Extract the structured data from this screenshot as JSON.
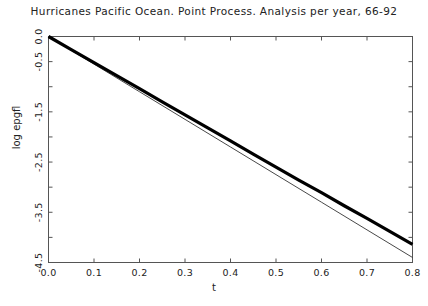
{
  "chart_data": {
    "type": "line",
    "title": "Hurricanes Pacific Ocean. Point Process. Analysis per year, 66-92",
    "xlabel": "t",
    "ylabel": "log epgfl",
    "xlim": [
      0.0,
      0.8
    ],
    "ylim": [
      -4.5,
      0.0
    ],
    "grid": false,
    "legend": null,
    "xticks": [
      0.0,
      0.1,
      0.2,
      0.3,
      0.4,
      0.5,
      0.6,
      0.7,
      0.8
    ],
    "xticklabels": [
      "0.0",
      "0.1",
      "0.2",
      "0.3",
      "0.4",
      "0.5",
      "0.6",
      "0.7",
      "0.8"
    ],
    "yticks": [
      0.0,
      -0.5,
      -1.0,
      -1.5,
      -2.0,
      -2.5,
      -3.0,
      -3.5,
      -4.0,
      -4.5
    ],
    "yticklabels": [
      "0.0",
      "-0.5",
      "",
      "-1.5",
      "",
      "-2.5",
      "",
      "-3.5",
      "",
      "-4.5"
    ],
    "series": [
      {
        "name": "empirical-epgfl",
        "style": "thick-solid",
        "color": "#000000",
        "linewidth": 3.2,
        "x": [
          0.0,
          0.05,
          0.1,
          0.15,
          0.2,
          0.25,
          0.3,
          0.35,
          0.4,
          0.45,
          0.5,
          0.55,
          0.6,
          0.65,
          0.7,
          0.75,
          0.8
        ],
        "y": [
          0.0,
          -0.26,
          -0.52,
          -0.78,
          -1.04,
          -1.3,
          -1.56,
          -1.82,
          -2.08,
          -2.34,
          -2.6,
          -2.86,
          -3.11,
          -3.37,
          -3.62,
          -3.88,
          -4.14
        ]
      },
      {
        "name": "fitted-poisson-reference",
        "style": "thin-solid",
        "color": "#333333",
        "linewidth": 0.9,
        "x": [
          0.0,
          0.1,
          0.2,
          0.3,
          0.4,
          0.5,
          0.6,
          0.7,
          0.8
        ],
        "y": [
          0.0,
          -0.55,
          -1.1,
          -1.65,
          -2.2,
          -2.75,
          -3.3,
          -3.85,
          -4.4
        ]
      }
    ]
  },
  "axes": {
    "frame_color": "#555555",
    "tick_color": "#555555"
  }
}
